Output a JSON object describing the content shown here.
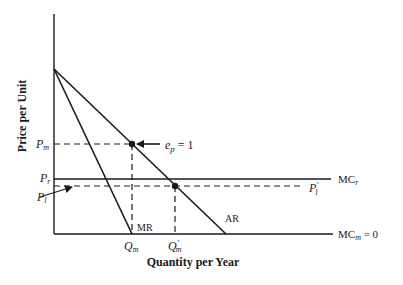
{
  "diagram": {
    "type": "economics-monopoly-pricing",
    "axes": {
      "y_label": "Price per Unit",
      "x_label": "Quantity per Year"
    },
    "curves": {
      "ar": {
        "label": "AR",
        "description": "average revenue (demand) curve"
      },
      "mr": {
        "label": "MR",
        "description": "marginal revenue curve"
      },
      "mc_r": {
        "label_main": "MC",
        "label_sub": "r",
        "description": "horizontal marginal cost line at P_r"
      },
      "mc_m": {
        "label_main": "MC",
        "label_sub": "m",
        "label_suffix": " = 0",
        "description": "marginal cost zero along quantity axis"
      },
      "p_l_prime": {
        "label_main": "P",
        "label_sub": "l",
        "label_prime": "′",
        "description": "dashed line at P_l"
      }
    },
    "price_labels": {
      "pm": {
        "main": "P",
        "sub": "m"
      },
      "pr": {
        "main": "P",
        "sub": "r"
      },
      "pl": {
        "main": "P",
        "sub": "l"
      }
    },
    "quantity_labels": {
      "qm": {
        "main": "Q",
        "sub": "m"
      },
      "qm_prime": {
        "main": "Q",
        "sub": "m",
        "prime": "′"
      }
    },
    "annotations": {
      "elasticity": {
        "main": "e",
        "sub": "p",
        "suffix": " = 1"
      }
    }
  }
}
